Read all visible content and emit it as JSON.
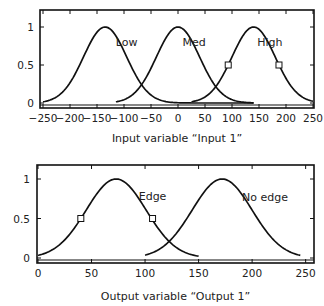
{
  "chart_data": [
    {
      "type": "line",
      "title": "",
      "xlabel": "Input variable “Input 1”",
      "ylabel": "",
      "xlim": [
        -250,
        250
      ],
      "ylim": [
        0,
        1
      ],
      "xticks": [
        -250,
        -200,
        -150,
        -100,
        -50,
        0,
        50,
        100,
        150,
        200,
        250
      ],
      "xtick_labels": [
        "−250",
        "−200",
        "−150",
        "−100",
        "−50",
        "0",
        "50",
        "100",
        "150",
        "200",
        "250"
      ],
      "yticks": [
        0,
        0.5,
        1
      ],
      "ytick_labels": [
        "0",
        "0.5",
        "1"
      ],
      "grid": false,
      "series": [
        {
          "name": "Low",
          "kind": "gaussian",
          "center": -135,
          "sigma": 40,
          "x_range": [
            -250,
            140
          ]
        },
        {
          "name": "Med",
          "kind": "gaussian",
          "center": 0,
          "sigma": 40,
          "x_range": [
            -115,
            140
          ]
        },
        {
          "name": "High",
          "kind": "gaussian",
          "center": 140,
          "sigma": 40,
          "x_range": [
            25,
            250
          ]
        }
      ],
      "markers": [
        {
          "series": "High",
          "x": 93,
          "y": 0.5
        },
        {
          "series": "High",
          "x": 187,
          "y": 0.5
        }
      ],
      "labels": [
        {
          "text": "Low",
          "x": -95,
          "y": 0.75
        },
        {
          "text": "Med",
          "x": 30,
          "y": 0.75
        },
        {
          "text": "High",
          "x": 170,
          "y": 0.75
        }
      ]
    },
    {
      "type": "line",
      "title": "",
      "xlabel": "Output variable “Output 1”",
      "ylabel": "",
      "xlim": [
        0,
        255
      ],
      "ylim": [
        0,
        1
      ],
      "xticks": [
        0,
        50,
        100,
        150,
        200,
        250
      ],
      "xtick_labels": [
        "0",
        "50",
        "100",
        "150",
        "200",
        "250"
      ],
      "yticks": [
        0,
        0.5,
        1
      ],
      "ytick_labels": [
        "0",
        "0.5",
        "1"
      ],
      "grid": false,
      "series": [
        {
          "name": "Edge",
          "kind": "gaussian",
          "center": 73,
          "sigma": 28,
          "x_range": [
            0,
            150
          ]
        },
        {
          "name": "No edge",
          "kind": "gaussian",
          "center": 172,
          "sigma": 28,
          "x_range": [
            100,
            245
          ]
        }
      ],
      "markers": [
        {
          "series": "Edge",
          "x": 40,
          "y": 0.5
        },
        {
          "series": "Edge",
          "x": 107,
          "y": 0.5
        }
      ],
      "labels": [
        {
          "text": "Edge",
          "x": 107,
          "y": 0.73
        },
        {
          "text": "No edge",
          "x": 212,
          "y": 0.72
        }
      ]
    }
  ]
}
